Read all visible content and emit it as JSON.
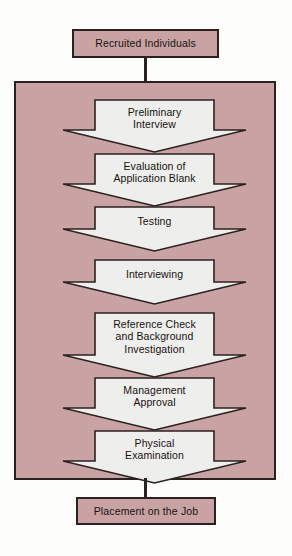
{
  "diagram": {
    "type": "flowchart",
    "orientation": "top-to-bottom",
    "colors": {
      "box_fill": "#c9a3a3",
      "arrow_fill": "#eeeeec",
      "outline": "#2b2220",
      "page_background": "#fdfdfb",
      "text": "#17120f"
    },
    "start_box": {
      "label": "Recruited Individuals"
    },
    "end_box": {
      "label": "Placement on the Job"
    },
    "process_steps": [
      {
        "index": 1,
        "lines": [
          "Preliminary",
          "Interview"
        ]
      },
      {
        "index": 2,
        "lines": [
          "Evaluation of",
          "Application Blank"
        ]
      },
      {
        "index": 3,
        "lines": [
          "Testing"
        ]
      },
      {
        "index": 4,
        "lines": [
          "Interviewing"
        ]
      },
      {
        "index": 5,
        "lines": [
          "Reference Check",
          "and Background",
          "Investigation"
        ]
      },
      {
        "index": 6,
        "lines": [
          "Management",
          "Approval"
        ]
      },
      {
        "index": 7,
        "lines": [
          "Physical",
          "Examination"
        ]
      }
    ]
  }
}
